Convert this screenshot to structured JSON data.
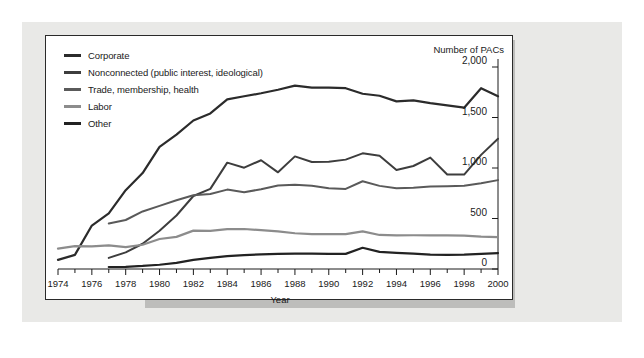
{
  "chart_data": {
    "type": "line",
    "title": "",
    "xlabel": "Year",
    "ylabel": "Number of PACs",
    "xlim": [
      1974,
      2000
    ],
    "ylim": [
      0,
      2000
    ],
    "grid": false,
    "legend_position": "top-left",
    "x": [
      1974,
      1975,
      1976,
      1977,
      1978,
      1979,
      1980,
      1981,
      1982,
      1983,
      1984,
      1985,
      1986,
      1987,
      1988,
      1989,
      1990,
      1991,
      1992,
      1993,
      1994,
      1995,
      1996,
      1997,
      1998,
      1999,
      2000
    ],
    "xtick_labels": [
      "1974",
      "1976",
      "1978",
      "1980",
      "1982",
      "1984",
      "1986",
      "1988",
      "1990",
      "1992",
      "1994",
      "1996",
      "1998",
      "2000"
    ],
    "ytick_labels": [
      "0",
      "500",
      "1,000",
      "1,500",
      "2,000"
    ],
    "ytick_values": [
      0,
      500,
      1000,
      1500,
      2000
    ],
    "series": [
      {
        "name": "Corporate",
        "color": "#2b2b2b",
        "width": 2.2,
        "x": [
          1974,
          1975,
          1976,
          1977,
          1978,
          1979,
          1980,
          1981,
          1982,
          1983,
          1984,
          1985,
          1986,
          1987,
          1988,
          1989,
          1990,
          1991,
          1992,
          1993,
          1994,
          1995,
          1996,
          1997,
          1998,
          1999,
          2000
        ],
        "values": [
          90,
          140,
          430,
          550,
          780,
          950,
          1210,
          1330,
          1470,
          1540,
          1680,
          1710,
          1740,
          1775,
          1816,
          1795,
          1795,
          1790,
          1735,
          1715,
          1660,
          1670,
          1642,
          1620,
          1597,
          1790,
          1710
        ]
      },
      {
        "name": "Nonconnected (public interest, ideological)",
        "color": "#3d3d3d",
        "width": 2.0,
        "x": [
          1977,
          1978,
          1979,
          1980,
          1981,
          1982,
          1983,
          1984,
          1985,
          1986,
          1987,
          1988,
          1989,
          1990,
          1991,
          1992,
          1993,
          1994,
          1995,
          1996,
          1997,
          1998,
          1999,
          2000
        ],
        "values": [
          110,
          165,
          250,
          378,
          530,
          723,
          793,
          1053,
          1003,
          1077,
          957,
          1115,
          1060,
          1062,
          1083,
          1145,
          1121,
          980,
          1020,
          1103,
          935,
          935,
          1130,
          1290
        ]
      },
      {
        "name": "Trade, membership, health",
        "color": "#5a5a5a",
        "width": 2.0,
        "x": [
          1977,
          1978,
          1979,
          1980,
          1981,
          1982,
          1983,
          1984,
          1985,
          1986,
          1987,
          1988,
          1989,
          1990,
          1991,
          1992,
          1993,
          1994,
          1995,
          1996,
          1997,
          1998,
          1999,
          2000
        ],
        "values": [
          450,
          485,
          570,
          625,
          680,
          730,
          742,
          786,
          760,
          790,
          827,
          835,
          824,
          800,
          793,
          869,
          823,
          800,
          805,
          816,
          820,
          824,
          850,
          880
        ]
      },
      {
        "name": "Labor",
        "color": "#8c8c8c",
        "width": 2.2,
        "x": [
          1974,
          1975,
          1976,
          1977,
          1978,
          1979,
          1980,
          1981,
          1982,
          1983,
          1984,
          1985,
          1986,
          1987,
          1988,
          1989,
          1990,
          1991,
          1992,
          1993,
          1994,
          1995,
          1996,
          1997,
          1998,
          1999,
          2000
        ],
        "values": [
          201,
          226,
          224,
          234,
          217,
          240,
          297,
          318,
          380,
          378,
          394,
          396,
          384,
          373,
          354,
          346,
          346,
          345,
          372,
          337,
          333,
          334,
          332,
          332,
          330,
          320,
          316
        ]
      },
      {
        "name": "Other",
        "color": "#222222",
        "width": 2.2,
        "x": [
          1977,
          1978,
          1979,
          1980,
          1981,
          1982,
          1983,
          1984,
          1985,
          1986,
          1987,
          1988,
          1989,
          1990,
          1991,
          1992,
          1993,
          1994,
          1995,
          1996,
          1997,
          1998,
          1999,
          2000
        ],
        "values": [
          20,
          22,
          30,
          42,
          60,
          90,
          110,
          128,
          138,
          145,
          150,
          152,
          152,
          150,
          150,
          210,
          170,
          160,
          152,
          143,
          140,
          142,
          150,
          158
        ]
      }
    ]
  }
}
